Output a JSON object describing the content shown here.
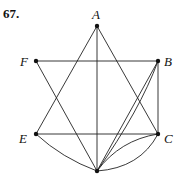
{
  "problem_number": "67.",
  "graph": {
    "vertices": [
      {
        "id": "A",
        "label": "A",
        "x": 97,
        "y": 26,
        "lx": 92,
        "ly": 19
      },
      {
        "id": "F",
        "label": "F",
        "x": 36,
        "y": 61,
        "lx": 20,
        "ly": 66
      },
      {
        "id": "B",
        "label": "B",
        "x": 158,
        "y": 61,
        "lx": 164,
        "ly": 66
      },
      {
        "id": "E",
        "label": "E",
        "x": 36,
        "y": 134,
        "lx": 19,
        "ly": 143
      },
      {
        "id": "C",
        "label": "C",
        "x": 158,
        "y": 134,
        "lx": 164,
        "ly": 143
      },
      {
        "id": "G",
        "label": "",
        "x": 97,
        "y": 171,
        "lx": 0,
        "ly": 0
      }
    ],
    "edges": [
      {
        "from": "A",
        "to": "E",
        "type": "line"
      },
      {
        "from": "A",
        "to": "C",
        "type": "line"
      },
      {
        "from": "A",
        "to": "G",
        "type": "line"
      },
      {
        "from": "F",
        "to": "B",
        "type": "line"
      },
      {
        "from": "F",
        "to": "G",
        "type": "line"
      },
      {
        "from": "B",
        "to": "C",
        "type": "line"
      },
      {
        "from": "E",
        "to": "C",
        "type": "line"
      },
      {
        "from": "E",
        "to": "G",
        "type": "curve",
        "cx": 62,
        "cy": 158
      },
      {
        "from": "B",
        "to": "G",
        "type": "line"
      },
      {
        "from": "B",
        "to": "G",
        "type": "curve",
        "cx": 140,
        "cy": 110
      },
      {
        "from": "C",
        "to": "G",
        "type": "curve",
        "cx": 120,
        "cy": 140
      },
      {
        "from": "C",
        "to": "G",
        "type": "curve",
        "cx": 140,
        "cy": 168
      }
    ]
  }
}
